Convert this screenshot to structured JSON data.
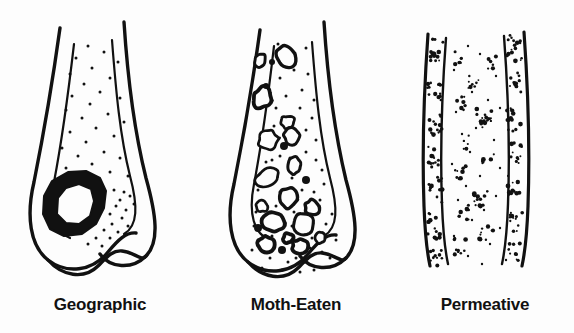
{
  "figure": {
    "background_color": "#fdfdfd",
    "ink_color": "#111111",
    "style": "black and white line drawing"
  },
  "panels": [
    {
      "id": "geographic",
      "caption": "Geographic",
      "bone": "distal femur",
      "lesion_description": "single well-defined thick-walled lytic lesion in the distal metaphysis",
      "lesion_count": 1,
      "stipple_count": 46
    },
    {
      "id": "moth-eaten",
      "caption": "Moth-Eaten",
      "bone": "distal femur",
      "lesion_description": "multiple medium-sized irregular lytic holes with ragged margins",
      "lesion_count": 23,
      "stipple_count": 52
    },
    {
      "id": "permeative",
      "caption": "Permeative",
      "bone": "diaphyseal shaft",
      "lesion_description": "innumerable tiny elongated lucencies concentrated in the cortex",
      "cluster_count": 26,
      "stipple_count": 120
    }
  ],
  "geometry": {
    "geographic": {
      "outer_left": "M 60 28 C 52 86 44 132 34 182 C 26 216 30 246 48 260 C 66 274 92 272 108 252 C 118 240 126 232 136 233",
      "outer_right": "M 124 22 C 128 84 134 130 146 178 C 156 214 160 242 146 256 C 132 270 110 268 100 254",
      "inner_left": "M 74 44 C 68 96 62 140 54 182 C 48 212 54 232 70 238",
      "inner_right": "M 112 40 C 116 92 120 136 130 176 C 138 206 138 226 124 234",
      "condyle": "M 48 260 C 62 276 84 280 98 266 C 106 258 112 250 122 251 C 134 252 142 262 146 256",
      "lesion_outer": [
        [
          44,
          196
        ],
        [
          52,
          181
        ],
        [
          68,
          172
        ],
        [
          86,
          171
        ],
        [
          100,
          178
        ],
        [
          106,
          191
        ],
        [
          104,
          208
        ],
        [
          96,
          224
        ],
        [
          82,
          234
        ],
        [
          64,
          236
        ],
        [
          50,
          229
        ],
        [
          43,
          214
        ]
      ],
      "lesion_inner": [
        [
          58,
          198
        ],
        [
          66,
          188
        ],
        [
          79,
          184
        ],
        [
          91,
          189
        ],
        [
          94,
          201
        ],
        [
          90,
          216
        ],
        [
          79,
          224
        ],
        [
          66,
          223
        ],
        [
          57,
          214
        ]
      ]
    },
    "moth": {
      "outer_left": "M 64 30 C 56 88 48 134 38 184 C 30 218 34 248 52 262 C 70 276 96 274 112 254 C 122 242 130 234 140 235",
      "outer_right": "M 128 22 C 132 84 138 130 150 180 C 160 216 164 244 150 258 C 136 272 114 270 104 256",
      "inner_left": "M 78 46 C 72 98 66 142 58 184 C 52 214 58 234 74 240",
      "inner_right": "M 116 42 C 120 94 124 138 134 178 C 142 208 142 228 128 236",
      "condyle": "M 52 262 C 66 278 88 282 102 268 C 110 260 116 252 126 253 C 138 254 146 264 150 258"
    },
    "permeative": {
      "outer_left": "M 32 34 C 28 90 26 150 28 206 C 29 234 31 252 34 266",
      "inner_left": "M 50 38 C 46 92 44 150 46 204 C 47 232 49 250 52 264",
      "inner_right": "M 108 36 C 112 90 114 150 112 204 C 111 232 109 250 106 264",
      "outer_right": "M 128 32 C 132 88 134 150 132 206 C 131 234 129 252 126 266"
    }
  },
  "lesions_moth": [
    {
      "cx": 64,
      "cy": 60,
      "rx": 6,
      "ry": 7,
      "rot": 12
    },
    {
      "cx": 90,
      "cy": 56,
      "rx": 10,
      "ry": 11,
      "rot": -18
    },
    {
      "cx": 76,
      "cy": 62,
      "rx": 3,
      "ry": 3,
      "rot": 0,
      "solid": true
    },
    {
      "cx": 66,
      "cy": 98,
      "rx": 9,
      "ry": 11,
      "rot": 14
    },
    {
      "cx": 70,
      "cy": 86,
      "rx": 3,
      "ry": 3,
      "rot": 0,
      "solid": true
    },
    {
      "cx": 92,
      "cy": 122,
      "rx": 7,
      "ry": 7,
      "rot": 0
    },
    {
      "cx": 96,
      "cy": 136,
      "rx": 8,
      "ry": 8,
      "rot": 20
    },
    {
      "cx": 72,
      "cy": 140,
      "rx": 10,
      "ry": 10,
      "rot": -10
    },
    {
      "cx": 88,
      "cy": 146,
      "rx": 4,
      "ry": 4,
      "rot": 0,
      "solid": true
    },
    {
      "cx": 98,
      "cy": 166,
      "rx": 7,
      "ry": 9,
      "rot": 8
    },
    {
      "cx": 72,
      "cy": 178,
      "rx": 12,
      "ry": 9,
      "rot": -12
    },
    {
      "cx": 110,
      "cy": 180,
      "rx": 4,
      "ry": 4,
      "rot": 0,
      "solid": true
    },
    {
      "cx": 92,
      "cy": 198,
      "rx": 10,
      "ry": 10,
      "rot": 10
    },
    {
      "cx": 66,
      "cy": 206,
      "rx": 6,
      "ry": 6,
      "rot": 0
    },
    {
      "cx": 116,
      "cy": 208,
      "rx": 7,
      "ry": 8,
      "rot": -14
    },
    {
      "cx": 78,
      "cy": 222,
      "rx": 11,
      "ry": 9,
      "rot": 6
    },
    {
      "cx": 108,
      "cy": 224,
      "rx": 12,
      "ry": 11,
      "rot": -8
    },
    {
      "cx": 62,
      "cy": 228,
      "rx": 4,
      "ry": 4,
      "rot": 0,
      "solid": true
    },
    {
      "cx": 92,
      "cy": 238,
      "rx": 5,
      "ry": 5,
      "rot": 0
    },
    {
      "cx": 70,
      "cy": 244,
      "rx": 9,
      "ry": 8,
      "rot": 16
    },
    {
      "cx": 104,
      "cy": 246,
      "rx": 8,
      "ry": 7,
      "rot": -6
    },
    {
      "cx": 86,
      "cy": 250,
      "rx": 4,
      "ry": 4,
      "rot": 0,
      "solid": true
    },
    {
      "cx": 124,
      "cy": 238,
      "rx": 5,
      "ry": 6,
      "rot": 0
    }
  ],
  "stipple_geographic": [
    [
      88,
      46
    ],
    [
      104,
      52
    ],
    [
      76,
      58
    ],
    [
      118,
      62
    ],
    [
      92,
      68
    ],
    [
      70,
      74
    ],
    [
      110,
      78
    ],
    [
      84,
      84
    ],
    [
      100,
      92
    ],
    [
      72,
      96
    ],
    [
      120,
      98
    ],
    [
      90,
      104
    ],
    [
      66,
      110
    ],
    [
      108,
      114
    ],
    [
      82,
      118
    ],
    [
      124,
      122
    ],
    [
      96,
      128
    ],
    [
      70,
      132
    ],
    [
      114,
      136
    ],
    [
      86,
      142
    ],
    [
      62,
      148
    ],
    [
      104,
      152
    ],
    [
      78,
      156
    ],
    [
      120,
      158
    ],
    [
      92,
      164
    ],
    [
      66,
      168
    ],
    [
      110,
      172
    ],
    [
      58,
      180
    ],
    [
      128,
      176
    ],
    [
      114,
      190
    ],
    [
      124,
      192
    ],
    [
      120,
      200
    ],
    [
      130,
      196
    ],
    [
      116,
      206
    ],
    [
      126,
      210
    ],
    [
      110,
      214
    ],
    [
      122,
      218
    ],
    [
      134,
      204
    ],
    [
      112,
      224
    ],
    [
      128,
      226
    ],
    [
      104,
      230
    ],
    [
      118,
      232
    ],
    [
      96,
      238
    ],
    [
      110,
      238
    ],
    [
      88,
      244
    ],
    [
      102,
      246
    ]
  ],
  "stipple_moth": [
    [
      82,
      44
    ],
    [
      110,
      48
    ],
    [
      98,
      70
    ],
    [
      112,
      74
    ],
    [
      84,
      78
    ],
    [
      106,
      90
    ],
    [
      90,
      96
    ],
    [
      118,
      100
    ],
    [
      80,
      108
    ],
    [
      104,
      108
    ],
    [
      116,
      118
    ],
    [
      86,
      120
    ],
    [
      110,
      130
    ],
    [
      78,
      126
    ],
    [
      120,
      140
    ],
    [
      84,
      156
    ],
    [
      110,
      152
    ],
    [
      94,
      158
    ],
    [
      120,
      160
    ],
    [
      76,
      160
    ],
    [
      106,
      190
    ],
    [
      84,
      192
    ],
    [
      118,
      192
    ],
    [
      62,
      190
    ],
    [
      96,
      178
    ],
    [
      126,
      170
    ],
    [
      70,
      162
    ],
    [
      128,
      184
    ],
    [
      98,
      212
    ],
    [
      124,
      200
    ],
    [
      60,
      212
    ],
    [
      80,
      206
    ],
    [
      116,
      238
    ],
    [
      62,
      240
    ],
    [
      96,
      226
    ],
    [
      130,
      224
    ],
    [
      74,
      258
    ],
    [
      92,
      262
    ],
    [
      108,
      262
    ],
    [
      126,
      252
    ],
    [
      56,
      250
    ],
    [
      140,
      240
    ],
    [
      86,
      270
    ],
    [
      104,
      272
    ],
    [
      118,
      270
    ],
    [
      66,
      268
    ],
    [
      134,
      258
    ],
    [
      76,
      236
    ],
    [
      100,
      258
    ],
    [
      114,
      248
    ],
    [
      58,
      226
    ],
    [
      136,
      214
    ]
  ],
  "clusters_permeative": [
    {
      "cx": 40,
      "cy": 50,
      "n": 14,
      "sx": 7,
      "sy": 12
    },
    {
      "cx": 118,
      "cy": 48,
      "n": 16,
      "sx": 8,
      "sy": 13
    },
    {
      "cx": 62,
      "cy": 58,
      "n": 7,
      "sx": 5,
      "sy": 8
    },
    {
      "cx": 96,
      "cy": 62,
      "n": 6,
      "sx": 5,
      "sy": 7
    },
    {
      "cx": 38,
      "cy": 88,
      "n": 13,
      "sx": 7,
      "sy": 13
    },
    {
      "cx": 120,
      "cy": 84,
      "n": 12,
      "sx": 7,
      "sy": 12
    },
    {
      "cx": 78,
      "cy": 80,
      "n": 8,
      "sx": 6,
      "sy": 9
    },
    {
      "cx": 66,
      "cy": 104,
      "n": 7,
      "sx": 5,
      "sy": 8
    },
    {
      "cx": 40,
      "cy": 124,
      "n": 14,
      "sx": 7,
      "sy": 14
    },
    {
      "cx": 118,
      "cy": 120,
      "n": 13,
      "sx": 7,
      "sy": 13
    },
    {
      "cx": 88,
      "cy": 118,
      "n": 16,
      "sx": 9,
      "sy": 10
    },
    {
      "cx": 70,
      "cy": 142,
      "n": 6,
      "sx": 5,
      "sy": 7
    },
    {
      "cx": 38,
      "cy": 156,
      "n": 12,
      "sx": 7,
      "sy": 12
    },
    {
      "cx": 120,
      "cy": 152,
      "n": 11,
      "sx": 7,
      "sy": 12
    },
    {
      "cx": 92,
      "cy": 160,
      "n": 9,
      "sx": 6,
      "sy": 9
    },
    {
      "cx": 64,
      "cy": 172,
      "n": 8,
      "sx": 6,
      "sy": 8
    },
    {
      "cx": 40,
      "cy": 190,
      "n": 13,
      "sx": 7,
      "sy": 13
    },
    {
      "cx": 118,
      "cy": 186,
      "n": 12,
      "sx": 7,
      "sy": 12
    },
    {
      "cx": 86,
      "cy": 196,
      "n": 15,
      "sx": 8,
      "sy": 11
    },
    {
      "cx": 68,
      "cy": 212,
      "n": 7,
      "sx": 5,
      "sy": 8
    },
    {
      "cx": 38,
      "cy": 226,
      "n": 13,
      "sx": 7,
      "sy": 13
    },
    {
      "cx": 120,
      "cy": 222,
      "n": 12,
      "sx": 7,
      "sy": 12
    },
    {
      "cx": 90,
      "cy": 234,
      "n": 10,
      "sx": 7,
      "sy": 9
    },
    {
      "cx": 64,
      "cy": 246,
      "n": 9,
      "sx": 6,
      "sy": 9
    },
    {
      "cx": 40,
      "cy": 256,
      "n": 11,
      "sx": 6,
      "sy": 10
    },
    {
      "cx": 118,
      "cy": 252,
      "n": 10,
      "sx": 6,
      "sy": 10
    }
  ],
  "stipple_permeative_scatter": [
    [
      72,
      46
    ],
    [
      84,
      54
    ],
    [
      58,
      70
    ],
    [
      100,
      76
    ],
    [
      76,
      92
    ],
    [
      92,
      100
    ],
    [
      60,
      112
    ],
    [
      104,
      108
    ],
    [
      80,
      128
    ],
    [
      66,
      134
    ],
    [
      98,
      140
    ],
    [
      74,
      152
    ],
    [
      56,
      164
    ],
    [
      104,
      168
    ],
    [
      84,
      176
    ],
    [
      70,
      186
    ],
    [
      100,
      196
    ],
    [
      62,
      200
    ],
    [
      88,
      210
    ],
    [
      76,
      220
    ],
    [
      104,
      228
    ],
    [
      58,
      236
    ],
    [
      94,
      244
    ],
    [
      72,
      256
    ],
    [
      86,
      264
    ],
    [
      110,
      260
    ]
  ]
}
